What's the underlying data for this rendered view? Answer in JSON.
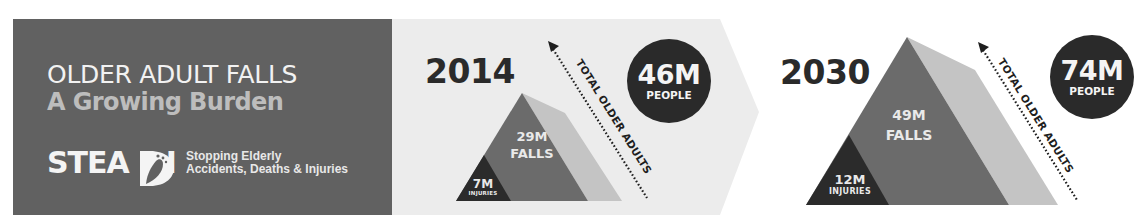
{
  "header": {
    "title": "OLDER ADULT FALLS",
    "subtitle": "A Growing Burden"
  },
  "logo": {
    "wordmark": "STEA I",
    "wordmark_full": "STEADI",
    "tagline_line1": "Stopping Elderly",
    "tagline_line2": "Accidents, Deaths & Injuries"
  },
  "panels": [
    {
      "year": "2014",
      "total_label": "TOTAL OLDER ADULTS",
      "people_value": "46M",
      "people_label": "PEOPLE",
      "falls_value": "29M",
      "falls_label": "FALLS",
      "injuries_value": "7M",
      "injuries_label": "INJURIES"
    },
    {
      "year": "2030",
      "total_label": "TOTAL OLDER ADULTS",
      "people_value": "74M",
      "people_label": "PEOPLE",
      "falls_value": "49M",
      "falls_label": "FALLS",
      "injuries_value": "12M",
      "injuries_label": "INJURIES"
    }
  ],
  "colors": {
    "dark_panel": "#616161",
    "light_panel": "#ececec",
    "pyramid_mid": "#6b6b6b",
    "pyramid_back": "#c4c4c4",
    "pyramid_injuries": "#2b2b2b",
    "circle": "#2a2a2a"
  }
}
